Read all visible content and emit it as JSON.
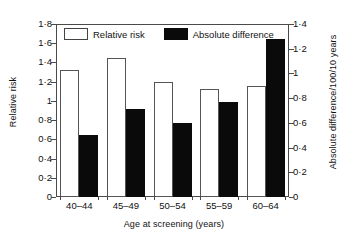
{
  "chart_data": {
    "type": "bar",
    "title": "",
    "xlabel": "Age at screening (years)",
    "categories": [
      "40–44",
      "45–49",
      "50–54",
      "55–59",
      "60–64"
    ],
    "series": [
      {
        "name": "Relative risk",
        "axis": "left",
        "color": "#ffffff",
        "edge_color": "#555555",
        "values": [
          1.32,
          1.45,
          1.2,
          1.12,
          1.16
        ]
      },
      {
        "name": "Absolute difference",
        "axis": "right",
        "color": "#0a0a0a",
        "edge_color": "#0a0a0a",
        "values": [
          0.5,
          0.71,
          0.6,
          0.77,
          1.28
        ]
      }
    ],
    "y_left": {
      "label": "Relative risk",
      "ylim": [
        0,
        1.8
      ],
      "ticks": [
        0,
        0.2,
        0.4,
        0.6,
        0.8,
        1.0,
        1.2,
        1.4,
        1.6,
        1.8
      ],
      "tick_labels": [
        "0",
        "0·2",
        "0·4",
        "0·6",
        "0·8",
        "1",
        "1·2",
        "1·4",
        "1·6",
        "1·8"
      ]
    },
    "y_right": {
      "label": "Absolute difference/100/10 years",
      "ylim": [
        0,
        1.4
      ],
      "ticks": [
        0,
        0.2,
        0.4,
        0.6,
        0.8,
        1.0,
        1.2,
        1.4
      ],
      "tick_labels": [
        "0",
        "0·2",
        "0·4",
        "0·6",
        "0·8",
        "1",
        "1·2",
        "1·4"
      ]
    },
    "grid": false,
    "legend": {
      "position": "top-left-inside",
      "entries": [
        {
          "label": "Relative risk",
          "swatch": "open"
        },
        {
          "label": "Absolute difference",
          "swatch": "filled"
        }
      ]
    }
  }
}
